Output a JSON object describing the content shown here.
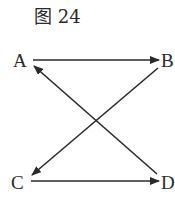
{
  "figure": {
    "title": "图 24",
    "stroke_color": "#2a2a2a"
  },
  "nodes": [
    {
      "id": "A",
      "label": "A"
    },
    {
      "id": "B",
      "label": "B"
    },
    {
      "id": "C",
      "label": "C"
    },
    {
      "id": "D",
      "label": "D"
    }
  ],
  "edges": [
    {
      "from": "A",
      "to": "B"
    },
    {
      "from": "B",
      "to": "C"
    },
    {
      "from": "C",
      "to": "D"
    },
    {
      "from": "D",
      "to": "A"
    }
  ]
}
